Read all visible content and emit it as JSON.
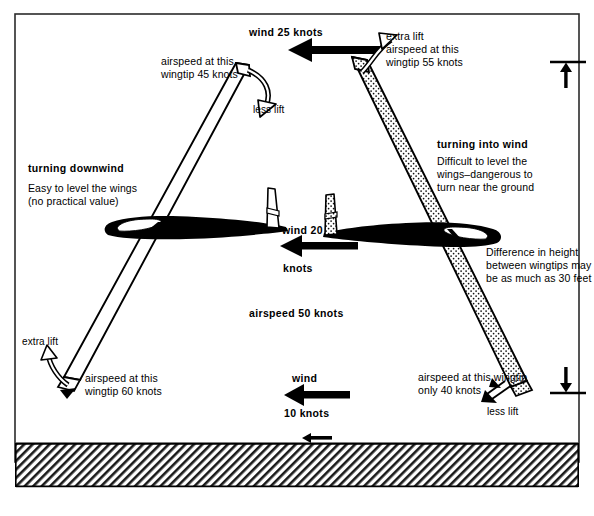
{
  "figure": {
    "frame_color": "#2b2b2b",
    "background": "#ffffff",
    "ink": "#000000"
  },
  "wind_arrows": [
    {
      "id": "top",
      "label_above": "wind 25 knots",
      "label_below": "",
      "speed_knots": 25,
      "direction": "left"
    },
    {
      "id": "middle",
      "label_above": "wind 20",
      "label_below": "knots",
      "speed_knots": 20,
      "direction": "left"
    },
    {
      "id": "lower",
      "label_above": "wind",
      "label_below": "10 knots",
      "speed_knots": 10,
      "direction": "left"
    },
    {
      "id": "ground",
      "label_above": "",
      "label_below": "",
      "speed_knots": null,
      "direction": "left"
    }
  ],
  "callouts": {
    "left_heading": "turning downwind",
    "left_body": "Easy to level the wings\n(no practical value)",
    "right_heading": "turning into wind",
    "right_body": "Difficult to level the\nwings–dangerous to\nturn near the ground",
    "height_note": "Difference in height\nbetween wingtips may\nbe as much as 30 feet",
    "airspeed_centre": "airspeed 50 knots"
  },
  "wingtips": {
    "upper_left": {
      "airspeed_label": "airspeed at this\nwingtip 45 knots",
      "lift_label": "less lift",
      "knots": 45
    },
    "upper_right": {
      "airspeed_label": "extra lift\nairspeed at  this\nwingtip 55 knots",
      "lift_label": "extra lift",
      "knots": 55
    },
    "lower_left": {
      "airspeed_label": "airspeed at this\nwingtip 60 knots",
      "lift_label": "extra lift",
      "knots": 60
    },
    "lower_right": {
      "airspeed_label": "airspeed at this wingtip\nonly 40 knots",
      "lift_label": "less lift",
      "knots": 40
    }
  },
  "ground": {
    "style": "hatched",
    "label": ""
  },
  "height_markers": {
    "top": {
      "arrow": "up"
    },
    "bottom": {
      "arrow": "down"
    }
  }
}
